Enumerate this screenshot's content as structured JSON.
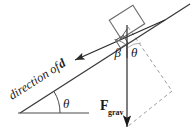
{
  "figure": {
    "kind": "physics-free-body-diagram",
    "colors": {
      "stroke": "#3a3a3a",
      "stroke_dark": "#1a1a1a",
      "dashed": "#8a8a8a",
      "background": "#ffffff"
    },
    "labels": {
      "displacement_direction": "direction of d",
      "displacement_symbol": "d",
      "displacement_prefix": "direction of ",
      "incline_angle": "θ",
      "beta_angle": "β",
      "theta_angle": "θ",
      "force_symbol": "F",
      "force_subscript": "grav"
    },
    "geometry": {
      "incline_start": [
        20,
        113
      ],
      "incline_end": [
        189,
        5
      ],
      "baseline_start": [
        18,
        113
      ],
      "baseline_end": [
        89,
        113
      ],
      "block_center": [
        127,
        22
      ],
      "gravity_arrow_top": [
        127,
        25
      ],
      "gravity_arrow_tip": [
        127,
        129
      ],
      "parallelogram_vertex": [
        172,
        91
      ],
      "displacement_arrow_tip": [
        73,
        61
      ],
      "incline_angle_degrees": 33
    }
  }
}
